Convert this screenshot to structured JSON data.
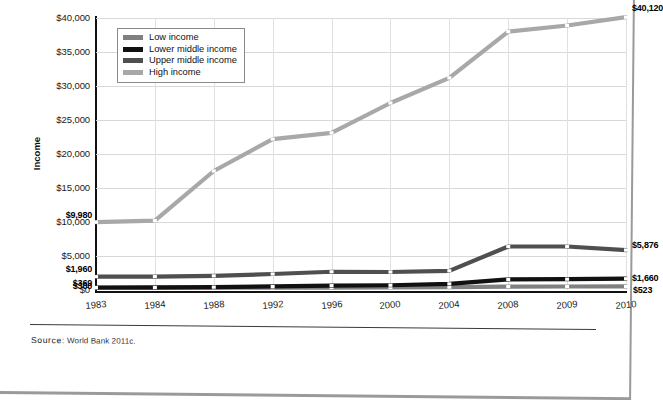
{
  "figure": {
    "source_prefix": "Source:",
    "source_text": "World Bank 2011c."
  },
  "colors": {
    "low_income": "#808080",
    "lower_middle_income": "#111111",
    "upper_middle_income": "#4f4f4f",
    "high_income": "#a8a8a8",
    "grid": "#d8d8d8",
    "axis": "#111111"
  },
  "chart_data": {
    "type": "line",
    "title": "",
    "xlabel": "",
    "ylabel": "Income",
    "ylim": [
      0,
      40000
    ],
    "grid": true,
    "legend_position": "top-left",
    "categories": [
      "1983",
      "1984",
      "1988",
      "1992",
      "1996",
      "2000",
      "2004",
      "2008",
      "2009",
      "2010"
    ],
    "ytick_labels": [
      "$0",
      "$5,000",
      "$10,000",
      "$15,000",
      "$20,000",
      "$25,000",
      "$30,000",
      "$35,000",
      "$40,000"
    ],
    "ytick_values": [
      0,
      5000,
      10000,
      15000,
      20000,
      25000,
      30000,
      35000,
      40000
    ],
    "series": [
      {
        "name": "Low income",
        "values": [
          300,
          310,
          330,
          340,
          350,
          370,
          420,
          500,
          515,
          523
        ]
      },
      {
        "name": "Lower middle income",
        "values": [
          369,
          380,
          420,
          520,
          640,
          700,
          900,
          1560,
          1590,
          1660
        ]
      },
      {
        "name": "Upper middle income",
        "values": [
          1960,
          1980,
          2080,
          2350,
          2680,
          2650,
          2820,
          6400,
          6400,
          5876
        ]
      },
      {
        "name": "High income",
        "values": [
          9980,
          10200,
          17500,
          22200,
          23100,
          27500,
          31200,
          38000,
          38900,
          40120
        ]
      }
    ],
    "annotations": [
      {
        "text": "$9,980",
        "series": "High income",
        "category": "1983",
        "side": "left"
      },
      {
        "text": "$1,960",
        "series": "Upper middle income",
        "category": "1983",
        "side": "left"
      },
      {
        "text": "$369",
        "series": "Lower middle income",
        "category": "1983",
        "side": "left"
      },
      {
        "text": "$300",
        "series": "Low income",
        "category": "1983",
        "side": "left"
      },
      {
        "text": "$40,120",
        "series": "High income",
        "category": "2010",
        "side": "right"
      },
      {
        "text": "$5,876",
        "series": "Upper middle income",
        "category": "2010",
        "side": "right"
      },
      {
        "text": "$1,660",
        "series": "Lower middle income",
        "category": "2010",
        "side": "right"
      },
      {
        "text": "$523",
        "series": "Low income",
        "category": "2010",
        "side": "right"
      }
    ]
  }
}
